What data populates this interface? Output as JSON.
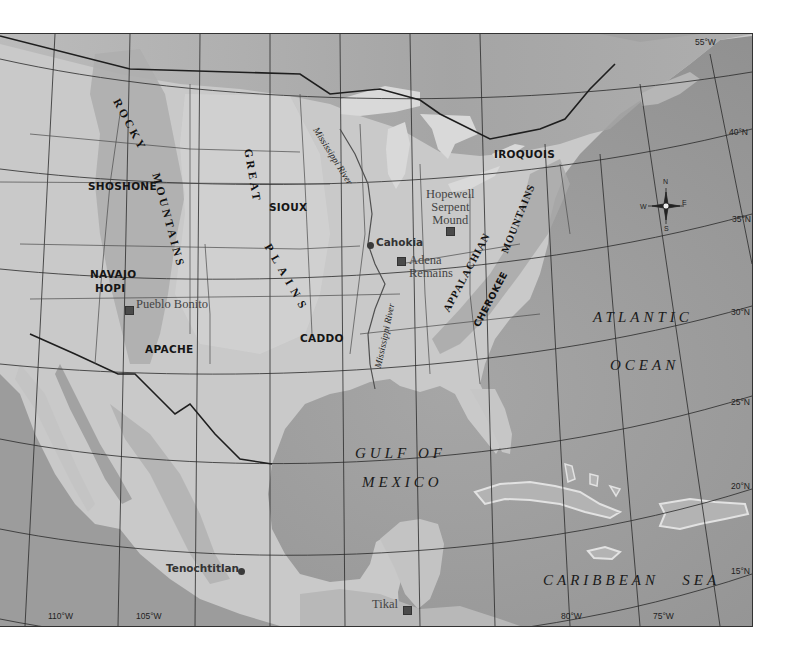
{
  "map": {
    "colors": {
      "ocean": "#9a9a9a",
      "land": "#c8c8c8",
      "land_light": "#d6d6d6",
      "mountains": "#a8a8a8",
      "lakes": "#d8d8d8",
      "borders": "#3a3a3a",
      "graticule": "#2a2a2a"
    },
    "peoples": [
      {
        "id": "shoshone",
        "label": "SHOSHONE"
      },
      {
        "id": "sioux",
        "label": "SIOUX"
      },
      {
        "id": "iroquois",
        "label": "IROQUOIS"
      },
      {
        "id": "navajo",
        "label": "NAVAJO"
      },
      {
        "id": "hopi",
        "label": "HOPI"
      },
      {
        "id": "apache",
        "label": "APACHE"
      },
      {
        "id": "caddo",
        "label": "CADDO"
      },
      {
        "id": "cherokee",
        "label": "CHEROKEE"
      }
    ],
    "sites": [
      {
        "id": "cahokia",
        "label": "Cahokia",
        "marker": "dot"
      },
      {
        "id": "hopewell",
        "label_lines": [
          "Hopewell",
          "Serpent",
          "Mound"
        ],
        "marker": "square"
      },
      {
        "id": "adena",
        "label_lines": [
          "Adena",
          "Remains"
        ],
        "marker": "square"
      },
      {
        "id": "pueblo-bonito",
        "label": "Pueblo Bonito",
        "marker": "square"
      },
      {
        "id": "tenochtitlan",
        "label": "Tenochtitlan",
        "marker": "dot"
      },
      {
        "id": "tikal",
        "label": "Tikal",
        "marker": "square"
      }
    ],
    "physical_features": {
      "rocky_1": "ROCKY",
      "rocky_2": "MOUNTAINS",
      "plains_1": "GREAT",
      "plains_2": "PLAINS",
      "appalachian_1": "APPALACHIAN",
      "appalachian_2": "MOUNTAINS"
    },
    "rivers": [
      {
        "id": "mississippi-north",
        "label": "Mississippi River"
      },
      {
        "id": "mississippi-south",
        "label": "Mississippi River"
      }
    ],
    "water_bodies": {
      "atlantic_1": "ATLANTIC",
      "atlantic_2": "OCEAN",
      "gulf_1": "GULF OF",
      "gulf_2": "MEXICO",
      "caribbean": "CARIBBEAN   SEA"
    },
    "graticule": {
      "longitudes": [
        "110°W",
        "105°W",
        "80°W",
        "75°W",
        "55°W"
      ],
      "latitudes": [
        "40°N",
        "35°N",
        "30°N",
        "25°N",
        "20°N",
        "15°N"
      ]
    },
    "compass": {
      "n": "N",
      "s": "S",
      "e": "E",
      "w": "W"
    }
  }
}
